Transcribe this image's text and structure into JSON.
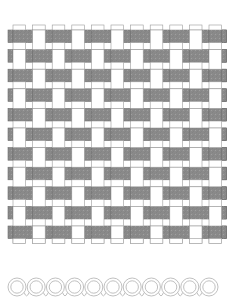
{
  "page": {
    "background_color": "#ffffff",
    "width": 240,
    "height": 308
  },
  "weave": {
    "title": "Basket Weave Pattern",
    "origin_x": 13,
    "origin_y": 30,
    "cells_x": 11,
    "cells_y": 11,
    "pitch": 19.6,
    "strip_width": 12.6,
    "gap": 7.0,
    "overhang": 5.0,
    "horizontal_strip_color": "#8a8a8a",
    "horizontal_strip_stroke": "#6e6e6e",
    "vertical_strip_color": "#ffffff",
    "vertical_strip_stroke": "#9a9a9a",
    "stroke_width": 0.6,
    "texture_opacity": 0.12,
    "texture_color": "#5f5f5f"
  },
  "spiral_border": {
    "title": "Spiral Loop Border",
    "count": 11,
    "start_x": 17,
    "baseline_y": 25,
    "pitch": 19.2,
    "outer_radius": 9.0,
    "inner_radius": 6.2,
    "stroke_color": "#b9b9b9",
    "stroke_width": 0.9,
    "fill": "none"
  }
}
